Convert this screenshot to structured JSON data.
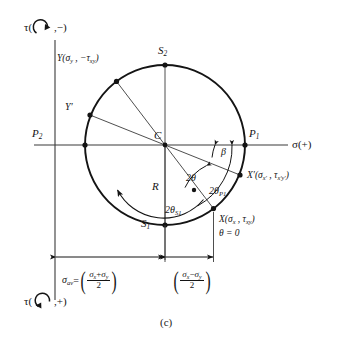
{
  "figure": {
    "caption": "(c)",
    "type": "mohr-circle-diagram"
  },
  "axes": {
    "horizontal_label": "σ(+)",
    "vertical_top_label_prefix": "τ(",
    "vertical_top_label_suffix": ",−)",
    "vertical_bottom_label_prefix": "τ(",
    "vertical_bottom_label_suffix": ",+)",
    "top_icon": "clockwise-arc-arrow",
    "bottom_icon": "counterclockwise-arc-arrow"
  },
  "points": {
    "center": {
      "name": "C",
      "label": "C"
    },
    "p1": {
      "name": "P1",
      "label": "P",
      "sub": "1"
    },
    "p2": {
      "name": "P2",
      "label": "P",
      "sub": "2"
    },
    "s1": {
      "name": "S1",
      "label": "S",
      "sub": "1"
    },
    "s2": {
      "name": "S2",
      "label": "S",
      "sub": "2"
    },
    "x": {
      "name": "X",
      "label_main": "X(σ",
      "sub1": "x",
      "mid": " , τ",
      "sub2": "xy",
      "tail": ")",
      "theta_note": "θ = 0"
    },
    "xprime": {
      "name": "X-prime",
      "label_main": "X′(σ",
      "sub1": "x′",
      "mid": " , τ",
      "sub2": "x′y′",
      "tail": ")"
    },
    "y": {
      "name": "Y",
      "label_main": "Y(σ",
      "sub1": "y",
      "mid": " , −τ",
      "sub2": "xy",
      "tail": ")"
    },
    "yprime": {
      "name": "Y-prime",
      "label": "Y′"
    }
  },
  "angles": {
    "two_theta": {
      "label": "2θ"
    },
    "beta": {
      "label": "β"
    },
    "two_theta_p1": {
      "label": "2θ",
      "sub": "P1"
    },
    "two_theta_s1": {
      "label": "2θ",
      "sub": "S1"
    },
    "radius": {
      "label": "R"
    }
  },
  "dimensions": {
    "sigma_av": {
      "lead": "σ",
      "lead_sub": "av",
      "equals": "=",
      "numerator": "σx + σy",
      "num_a": "σ",
      "num_a_sub": "x",
      "num_op": "+",
      "num_b": "σ",
      "num_b_sub": "y",
      "denominator": "2"
    },
    "half_diff": {
      "num_a": "σ",
      "num_a_sub": "x",
      "num_op": "−",
      "num_b": "σ",
      "num_b_sub": "y",
      "denominator": "2"
    }
  },
  "geometry": {
    "center_x": 165,
    "center_y": 145,
    "radius": 80,
    "stroke": "#141414",
    "thin_stroke": "#3a3a3a"
  }
}
